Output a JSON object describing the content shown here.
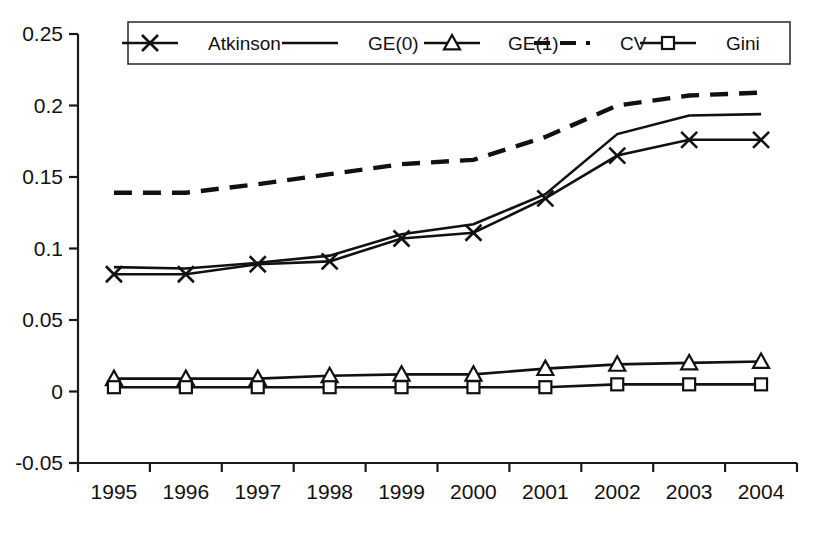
{
  "chart_data": {
    "type": "line",
    "title": "",
    "subtitle": "",
    "xlabel": "",
    "ylabel": "",
    "categories": [
      "1995",
      "1996",
      "1997",
      "1998",
      "1999",
      "2000",
      "2001",
      "2002",
      "2003",
      "2004"
    ],
    "x": [
      1995,
      1996,
      1997,
      1998,
      1999,
      2000,
      2001,
      2002,
      2003,
      2004
    ],
    "ylim": [
      -0.05,
      0.25
    ],
    "yticks": [
      -0.05,
      0,
      0.05,
      0.1,
      0.15,
      0.2,
      0.25
    ],
    "ytick_labels": [
      "-0.05",
      "0",
      "0.05",
      "0.1",
      "0.15",
      "0.2",
      "0.25"
    ],
    "xtick_labels": [
      "1995",
      "1996",
      "1997",
      "1998",
      "1999",
      "2000",
      "2001",
      "2002",
      "2003",
      "2004"
    ],
    "grid": false,
    "legend_position": "top",
    "series": [
      {
        "name": "Atkinson",
        "marker": "x",
        "style": "solid",
        "values": [
          0.082,
          0.082,
          0.089,
          0.091,
          0.107,
          0.111,
          0.135,
          0.165,
          0.176,
          0.176
        ]
      },
      {
        "name": "GE(0)",
        "marker": "none",
        "style": "solid",
        "values": [
          0.087,
          0.086,
          0.09,
          0.095,
          0.11,
          0.117,
          0.138,
          0.18,
          0.193,
          0.194
        ]
      },
      {
        "name": "GE(1)",
        "marker": "triangle",
        "style": "solid",
        "values": [
          0.009,
          0.009,
          0.009,
          0.011,
          0.012,
          0.012,
          0.016,
          0.019,
          0.02,
          0.021
        ]
      },
      {
        "name": "CV",
        "marker": "none",
        "style": "dashed",
        "values": [
          0.139,
          0.139,
          0.145,
          0.152,
          0.159,
          0.162,
          0.178,
          0.2,
          0.207,
          0.209
        ]
      },
      {
        "name": "Gini",
        "marker": "square",
        "style": "solid",
        "values": [
          0.003,
          0.003,
          0.003,
          0.003,
          0.003,
          0.003,
          0.003,
          0.005,
          0.005,
          0.005
        ]
      }
    ]
  },
  "legend": {
    "items": [
      {
        "label": "Atkinson"
      },
      {
        "label": "GE(0)"
      },
      {
        "label": "GE(1)"
      },
      {
        "label": "CV"
      },
      {
        "label": "Gini"
      }
    ]
  },
  "colors": {
    "line": "#111111",
    "axis": "#1a1a1a",
    "background": "#ffffff"
  }
}
